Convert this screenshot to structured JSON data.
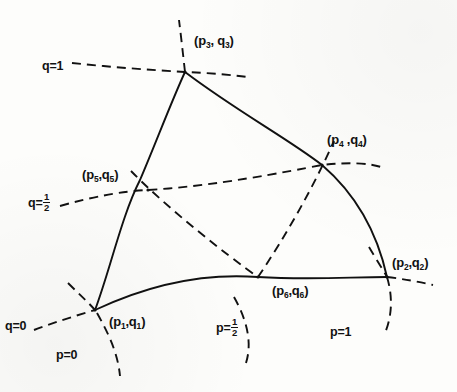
{
  "figure": {
    "kind": "curvilinear-triangle-coordinate-net",
    "stroke_color": "#111111",
    "background_color": "#fdfdfb",
    "solid_width": 1.9,
    "dashed_width": 1.9,
    "dash_pattern": "9 6"
  },
  "nodes": [
    {
      "id": "p1",
      "label_prefix": "(p",
      "label_sub1": "1",
      "label_mid": ",q",
      "label_sub2": "1",
      "label_suffix": ")",
      "text": "(p1,q1)",
      "x": 95,
      "y": 310,
      "label_x": 108,
      "label_y": 322
    },
    {
      "id": "p2",
      "label_prefix": "(p",
      "label_sub1": "2",
      "label_mid": ",q",
      "label_sub2": "2",
      "label_suffix": ")",
      "text": "(p2,q2)",
      "x": 387,
      "y": 277,
      "label_x": 392,
      "label_y": 263
    },
    {
      "id": "p3",
      "label_prefix": "(p",
      "label_sub1": "3",
      "label_mid": ", q",
      "label_sub2": "3",
      "label_suffix": ")",
      "text": "(p3, q3)",
      "x": 185,
      "y": 72,
      "label_x": 194,
      "label_y": 42
    },
    {
      "id": "p4",
      "label_prefix": "(p",
      "label_sub1": "4",
      "label_mid": " ,q",
      "label_sub2": "4",
      "label_suffix": ")",
      "text": "(p4 ,q4)",
      "x": 322,
      "y": 165,
      "label_x": 327,
      "label_y": 140
    },
    {
      "id": "p5",
      "label_prefix": "(p",
      "label_sub1": "5",
      "label_mid": ",q",
      "label_sub2": "5",
      "label_suffix": ")",
      "text": "(p5,q5)",
      "x": 148,
      "y": 190,
      "label_x": 84,
      "label_y": 175
    },
    {
      "id": "p6",
      "label_prefix": "(p",
      "label_sub1": "6",
      "label_mid": ",q",
      "label_sub2": "6",
      "label_suffix": ")",
      "text": "(p6,q6)",
      "x": 258,
      "y": 277,
      "label_x": 275,
      "label_y": 287
    }
  ],
  "axis_labels": [
    {
      "id": "q-eq-1",
      "text": "q=1",
      "value": "1",
      "param": "q",
      "fraction": false,
      "x": 42,
      "y": 66
    },
    {
      "id": "q-eq-half",
      "text": "q=",
      "value": "1/2",
      "param": "q",
      "fraction": true,
      "num": "1",
      "den": "2",
      "x": 30,
      "y": 198
    },
    {
      "id": "q-eq-0",
      "text": "q=0",
      "value": "0",
      "param": "q",
      "fraction": false,
      "x": 6,
      "y": 326
    },
    {
      "id": "p-eq-0",
      "text": "p=0",
      "value": "0",
      "param": "p",
      "fraction": false,
      "x": 56,
      "y": 355
    },
    {
      "id": "p-eq-half",
      "text": "p=",
      "value": "1/2",
      "param": "p",
      "fraction": true,
      "num": "1",
      "den": "2",
      "x": 218,
      "y": 322
    },
    {
      "id": "p-eq-1",
      "text": "p=1",
      "value": "1",
      "param": "p",
      "fraction": false,
      "x": 330,
      "y": 332
    }
  ],
  "curves": {
    "solid": [
      {
        "id": "side-p-eq-0",
        "name": "solid-side-p1-p5-p3",
        "from": "p1",
        "via": "p5",
        "to": "p3",
        "d": "M 95,310 Q 133,232 185,72"
      },
      {
        "id": "side-q-eq-0",
        "name": "solid-side-p1-p6-p2",
        "from": "p1",
        "via": "p6",
        "to": "p2",
        "d": "M 95,310 Q 243,262 387,277"
      },
      {
        "id": "side-p-eq-1",
        "name": "solid-side-p3-p4-p2",
        "from": "p3",
        "via": "p4",
        "to": "p2",
        "d": "M 185,72 Q 300,120 387,277"
      }
    ],
    "dashed": [
      {
        "id": "curve-q-eq-1",
        "name": "dashed-q-equals-1",
        "through": "p3",
        "d": "M 72,63 Q 135,70 246,76"
      },
      {
        "id": "curve-q-eq-half",
        "name": "dashed-q-equals-half",
        "through": "p5,p4",
        "d": "M 60,206 Q 200,166 380,168"
      },
      {
        "id": "curve-q-eq-0",
        "name": "dashed-q-equals-0",
        "through": "p1,p2",
        "d": "M 34,330 Q 70,318 95,310"
      },
      {
        "id": "curve-q-eq-0b",
        "name": "dashed-q-equals-0-ext-right",
        "through": "p2",
        "d": "M 387,277 Q 411,279 432,284"
      },
      {
        "id": "curve-p-eq-0",
        "name": "dashed-p-equals-0-ext",
        "through": "p1",
        "d": "M 70,285 Q 82,298 95,310"
      },
      {
        "id": "curve-p-eq-0b",
        "name": "dashed-p-equals-0-ext-up",
        "through": "p3",
        "d": "M 185,72 Q 182,45 179,20"
      },
      {
        "id": "curve-p-eq-half",
        "name": "dashed-p-equals-half",
        "through": "p5,p6,p4",
        "d": "M 132,172 Q 205,228 258,277 Q 300,228 334,140"
      },
      {
        "id": "curve-p-eq-half-low",
        "name": "dashed-p-equals-half-lower",
        "through": "p6",
        "d": "M 237,300 Q 250,330 244,360"
      },
      {
        "id": "curve-p-eq-1",
        "name": "dashed-p-equals-1-ext",
        "through": "p2",
        "d": "M 370,250 Q 379,263 387,277 Q 392,300 386,330"
      },
      {
        "id": "curve-p1-down",
        "name": "dashed-p1-branch-down",
        "through": "p1",
        "d": "M 95,310 Q 112,338 118,375"
      }
    ]
  }
}
